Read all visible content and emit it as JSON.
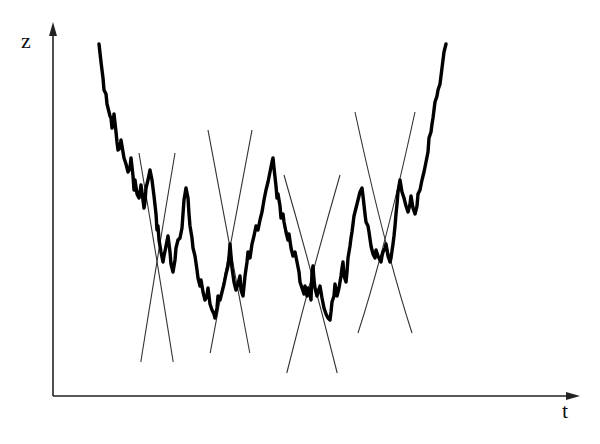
{
  "figure": {
    "axes": {
      "y_label": "z",
      "x_label": "t",
      "origin": [
        53,
        396
      ],
      "y_axis_top": [
        53,
        22
      ],
      "x_axis_right": [
        580,
        396
      ],
      "color": "#222222"
    },
    "curve": {
      "description": "fractal (Weierstrass-like) rough curve, U-shaped",
      "stroke": "#000000",
      "stroke_width": 3.4,
      "anchors": [
        [
          99,
          44
        ],
        [
          101,
          62
        ],
        [
          103,
          78
        ],
        [
          104,
          90
        ],
        [
          106,
          94
        ],
        [
          107,
          104
        ],
        [
          109,
          112
        ],
        [
          110,
          116
        ],
        [
          111,
          118
        ],
        [
          112,
          128
        ],
        [
          113,
          124
        ],
        [
          114,
          114
        ],
        [
          116,
          132
        ],
        [
          117,
          142
        ],
        [
          118,
          150
        ],
        [
          120,
          148
        ],
        [
          121,
          140
        ],
        [
          123,
          152
        ],
        [
          124,
          158
        ],
        [
          126,
          164
        ],
        [
          128,
          172
        ],
        [
          130,
          168
        ],
        [
          131,
          158
        ],
        [
          133,
          176
        ],
        [
          134,
          190
        ],
        [
          135,
          180
        ],
        [
          137,
          194
        ],
        [
          139,
          198
        ],
        [
          140,
          192
        ],
        [
          141,
          185
        ],
        [
          143,
          200
        ],
        [
          144,
          208
        ],
        [
          145,
          202
        ],
        [
          146,
          188
        ],
        [
          148,
          180
        ],
        [
          150,
          170
        ],
        [
          152,
          180
        ],
        [
          154,
          196
        ],
        [
          156,
          214
        ],
        [
          157,
          230
        ],
        [
          158,
          226
        ],
        [
          159,
          240
        ],
        [
          161,
          252
        ],
        [
          163,
          262
        ],
        [
          164,
          256
        ],
        [
          166,
          246
        ],
        [
          168,
          236
        ],
        [
          170,
          252
        ],
        [
          171,
          264
        ],
        [
          173,
          272
        ],
        [
          175,
          260
        ],
        [
          176,
          248
        ],
        [
          178,
          240
        ],
        [
          180,
          238
        ],
        [
          182,
          228
        ],
        [
          183,
          214
        ],
        [
          184,
          200
        ],
        [
          186,
          188
        ],
        [
          188,
          198
        ],
        [
          189,
          214
        ],
        [
          190,
          226
        ],
        [
          192,
          238
        ],
        [
          193,
          248
        ],
        [
          195,
          256
        ],
        [
          197,
          270
        ],
        [
          198,
          278
        ],
        [
          200,
          286
        ],
        [
          201,
          280
        ],
        [
          203,
          292
        ],
        [
          205,
          300
        ],
        [
          207,
          296
        ],
        [
          208,
          288
        ],
        [
          210,
          304
        ],
        [
          212,
          310
        ],
        [
          214,
          314
        ],
        [
          215,
          318
        ],
        [
          217,
          308
        ],
        [
          218,
          296
        ],
        [
          220,
          300
        ],
        [
          222,
          292
        ],
        [
          224,
          284
        ],
        [
          226,
          274
        ],
        [
          228,
          266
        ],
        [
          229,
          258
        ],
        [
          230,
          244
        ],
        [
          231,
          256
        ],
        [
          232,
          268
        ],
        [
          234,
          282
        ],
        [
          236,
          290
        ],
        [
          238,
          284
        ],
        [
          240,
          276
        ],
        [
          241,
          290
        ],
        [
          243,
          296
        ],
        [
          244,
          286
        ],
        [
          245,
          276
        ],
        [
          247,
          262
        ],
        [
          248,
          252
        ],
        [
          250,
          258
        ],
        [
          252,
          244
        ],
        [
          254,
          236
        ],
        [
          256,
          226
        ],
        [
          258,
          230
        ],
        [
          260,
          220
        ],
        [
          262,
          212
        ],
        [
          264,
          200
        ],
        [
          266,
          190
        ],
        [
          268,
          182
        ],
        [
          270,
          172
        ],
        [
          272,
          162
        ],
        [
          273,
          158
        ],
        [
          274,
          168
        ],
        [
          276,
          186
        ],
        [
          277,
          198
        ],
        [
          278,
          194
        ],
        [
          280,
          206
        ],
        [
          281,
          218
        ],
        [
          283,
          214
        ],
        [
          284,
          222
        ],
        [
          286,
          232
        ],
        [
          288,
          240
        ],
        [
          289,
          234
        ],
        [
          291,
          248
        ],
        [
          293,
          256
        ],
        [
          295,
          252
        ],
        [
          297,
          262
        ],
        [
          299,
          272
        ],
        [
          300,
          282
        ],
        [
          302,
          288
        ],
        [
          304,
          294
        ],
        [
          305,
          286
        ],
        [
          307,
          296
        ],
        [
          308,
          288
        ],
        [
          310,
          294
        ],
        [
          311,
          300
        ],
        [
          312,
          272
        ],
        [
          313,
          266
        ],
        [
          314,
          280
        ],
        [
          315,
          288
        ],
        [
          317,
          296
        ],
        [
          318,
          292
        ],
        [
          320,
          286
        ],
        [
          322,
          298
        ],
        [
          324,
          308
        ],
        [
          326,
          314
        ],
        [
          328,
          318
        ],
        [
          330,
          320
        ],
        [
          331,
          312
        ],
        [
          332,
          302
        ],
        [
          334,
          296
        ],
        [
          335,
          284
        ],
        [
          336,
          290
        ],
        [
          337,
          296
        ],
        [
          339,
          288
        ],
        [
          341,
          276
        ],
        [
          342,
          268
        ],
        [
          343,
          262
        ],
        [
          344,
          276
        ],
        [
          346,
          282
        ],
        [
          347,
          272
        ],
        [
          348,
          258
        ],
        [
          350,
          246
        ],
        [
          351,
          238
        ],
        [
          352,
          232
        ],
        [
          353,
          224
        ],
        [
          354,
          216
        ],
        [
          356,
          208
        ],
        [
          358,
          200
        ],
        [
          360,
          192
        ],
        [
          362,
          188
        ],
        [
          363,
          196
        ],
        [
          365,
          214
        ],
        [
          366,
          222
        ],
        [
          368,
          226
        ],
        [
          369,
          232
        ],
        [
          371,
          246
        ],
        [
          373,
          254
        ],
        [
          375,
          258
        ],
        [
          376,
          250
        ],
        [
          378,
          256
        ],
        [
          380,
          260
        ],
        [
          381,
          262
        ],
        [
          382,
          256
        ],
        [
          383,
          252
        ],
        [
          385,
          248
        ],
        [
          386,
          244
        ],
        [
          387,
          250
        ],
        [
          388,
          256
        ],
        [
          390,
          262
        ],
        [
          391,
          258
        ],
        [
          393,
          244
        ],
        [
          394,
          236
        ],
        [
          395,
          226
        ],
        [
          396,
          214
        ],
        [
          397,
          204
        ],
        [
          398,
          192
        ],
        [
          400,
          180
        ],
        [
          402,
          192
        ],
        [
          404,
          198
        ],
        [
          406,
          206
        ],
        [
          408,
          212
        ],
        [
          410,
          204
        ],
        [
          411,
          196
        ],
        [
          413,
          208
        ],
        [
          415,
          214
        ],
        [
          417,
          206
        ],
        [
          418,
          194
        ],
        [
          420,
          190
        ],
        [
          422,
          180
        ],
        [
          424,
          172
        ],
        [
          426,
          162
        ],
        [
          428,
          152
        ],
        [
          429,
          138
        ],
        [
          431,
          132
        ],
        [
          432,
          124
        ],
        [
          433,
          118
        ],
        [
          434,
          110
        ],
        [
          435,
          102
        ],
        [
          437,
          96
        ],
        [
          438,
          90
        ],
        [
          440,
          84
        ],
        [
          441,
          76
        ],
        [
          442,
          68
        ],
        [
          443,
          60
        ],
        [
          444,
          52
        ],
        [
          446,
          44
        ]
      ]
    },
    "cusps": [
      {
        "center_x": 157,
        "cross_y": 260,
        "top_y": 153,
        "bottom_y": 362,
        "half_width": 18
      },
      {
        "center_x": 230,
        "cross_y": 245,
        "top_y": 130,
        "bottom_y": 353,
        "half_width": 22
      },
      {
        "center_x": 312,
        "cross_y": 272,
        "top_y": 175,
        "bottom_y": 373,
        "half_width": 28
      },
      {
        "center_x": 385,
        "cross_y": 250,
        "top_y": 112,
        "bottom_y": 333,
        "half_width": 30
      }
    ],
    "cusp_stroke": "#333333"
  }
}
